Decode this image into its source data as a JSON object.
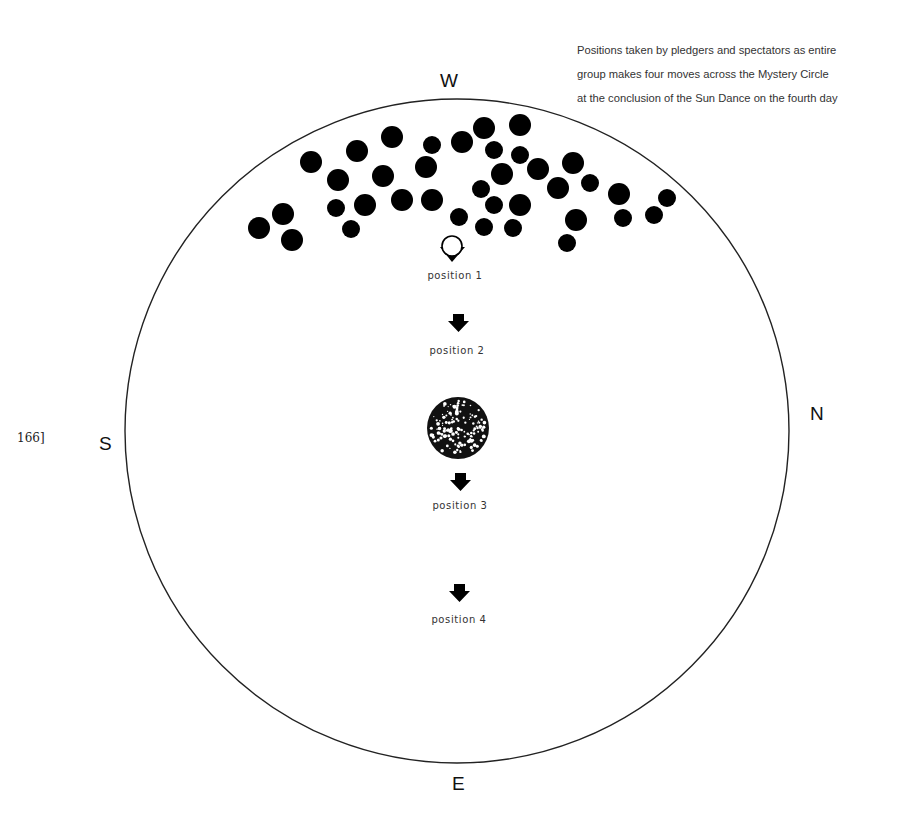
{
  "caption": {
    "lines": [
      "Positions taken by pledgers and spectators as entire",
      "group makes four moves across the Mystery Circle",
      "at the conclusion of the Sun Dance on the fourth day"
    ]
  },
  "page_number": "166]",
  "compass": {
    "west": "W",
    "north": "N",
    "east": "E",
    "south": "S"
  },
  "positions": [
    {
      "label": "position 1",
      "marker": "circle-with-arrow-icon"
    },
    {
      "label": "position 2",
      "marker": "down-arrow-icon"
    },
    {
      "label": "position 3",
      "marker": "down-arrow-icon"
    },
    {
      "label": "position 4",
      "marker": "down-arrow-icon"
    }
  ],
  "center_object": "tree-bush-icon",
  "circle": {
    "cx": 457,
    "cy": 431,
    "r": 332
  },
  "group_dots": [
    [
      259,
      228,
      11
    ],
    [
      283,
      214,
      11
    ],
    [
      292,
      240,
      11
    ],
    [
      311,
      162,
      11
    ],
    [
      338,
      180,
      11
    ],
    [
      357,
      151,
      11
    ],
    [
      336,
      208,
      9
    ],
    [
      351,
      229,
      9
    ],
    [
      365,
      205,
      11
    ],
    [
      383,
      176,
      11
    ],
    [
      392,
      137,
      11
    ],
    [
      402,
      200,
      11
    ],
    [
      426,
      167,
      11
    ],
    [
      432,
      145,
      9
    ],
    [
      432,
      200,
      11
    ],
    [
      459,
      217,
      9
    ],
    [
      462,
      142,
      11
    ],
    [
      484,
      128,
      11
    ],
    [
      494,
      150,
      9
    ],
    [
      481,
      189,
      9
    ],
    [
      502,
      174,
      11
    ],
    [
      494,
      205,
      9
    ],
    [
      484,
      227,
      9
    ],
    [
      520,
      125,
      11
    ],
    [
      520,
      155,
      9
    ],
    [
      520,
      205,
      11
    ],
    [
      513,
      228,
      9
    ],
    [
      538,
      169,
      11
    ],
    [
      558,
      188,
      11
    ],
    [
      573,
      163,
      11
    ],
    [
      576,
      220,
      11
    ],
    [
      567,
      243,
      9
    ],
    [
      590,
      183,
      9
    ],
    [
      619,
      194,
      11
    ],
    [
      623,
      218,
      9
    ],
    [
      654,
      215,
      9
    ],
    [
      667,
      198,
      9
    ]
  ]
}
